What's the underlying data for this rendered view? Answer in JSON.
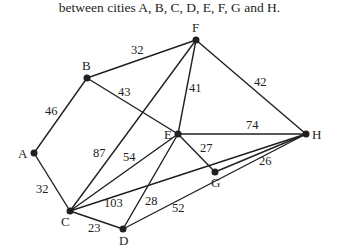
{
  "caption": "between cities A, B, C, D, E, F, G and H.",
  "graph": {
    "nodes": [
      {
        "id": "A",
        "x": 34,
        "y": 153
      },
      {
        "id": "B",
        "x": 87,
        "y": 78
      },
      {
        "id": "C",
        "x": 70,
        "y": 211
      },
      {
        "id": "D",
        "x": 123,
        "y": 229
      },
      {
        "id": "E",
        "x": 178,
        "y": 134
      },
      {
        "id": "F",
        "x": 196,
        "y": 40
      },
      {
        "id": "G",
        "x": 215,
        "y": 172
      },
      {
        "id": "H",
        "x": 306,
        "y": 134
      }
    ],
    "edges": [
      {
        "from": "A",
        "to": "B",
        "weight": "46"
      },
      {
        "from": "A",
        "to": "C",
        "weight": "32"
      },
      {
        "from": "B",
        "to": "F",
        "weight": "32"
      },
      {
        "from": "B",
        "to": "E",
        "weight": "43"
      },
      {
        "from": "F",
        "to": "E",
        "weight": "41"
      },
      {
        "from": "F",
        "to": "H",
        "weight": "42"
      },
      {
        "from": "F",
        "to": "C",
        "weight": "87"
      },
      {
        "from": "E",
        "to": "H",
        "weight": "74"
      },
      {
        "from": "E",
        "to": "G",
        "weight": "27"
      },
      {
        "from": "E",
        "to": "C",
        "weight": "54"
      },
      {
        "from": "E",
        "to": "D",
        "weight": "28"
      },
      {
        "from": "C",
        "to": "H",
        "weight": "103"
      },
      {
        "from": "C",
        "to": "D",
        "weight": "23"
      },
      {
        "from": "D",
        "to": "H",
        "weight": "52"
      },
      {
        "from": "G",
        "to": "H",
        "weight": "26"
      }
    ]
  },
  "labels": {
    "A": "A",
    "B": "B",
    "C": "C",
    "D": "D",
    "E": "E",
    "F": "F",
    "G": "G",
    "H": "H",
    "w_AB": "46",
    "w_AC": "32",
    "w_BF": "32",
    "w_BE": "43",
    "w_FE": "41",
    "w_FH": "42",
    "w_FC": "87",
    "w_EH": "74",
    "w_EG": "27",
    "w_EC": "54",
    "w_ED": "28",
    "w_CH": "103",
    "w_CD": "23",
    "w_DH": "52",
    "w_GH": "26"
  }
}
